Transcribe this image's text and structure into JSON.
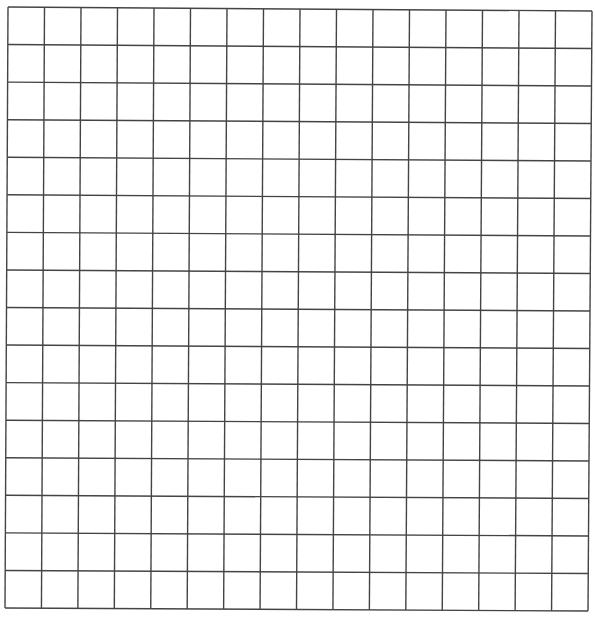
{
  "grid": {
    "columns": 16,
    "rows": 16,
    "line_color": "#444444",
    "background": "#ffffff",
    "corners": {
      "top_left": [
        8,
        7
      ],
      "top_right": [
        592,
        11
      ],
      "bottom_left": [
        5,
        608
      ],
      "bottom_right": [
        588,
        611
      ]
    }
  }
}
